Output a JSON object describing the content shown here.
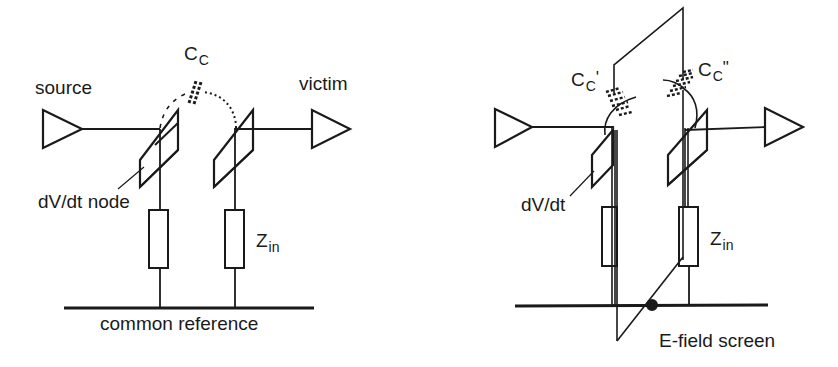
{
  "left_diagram": {
    "labels": {
      "source": "source",
      "victim": "victim",
      "coupling_cap_main": "C",
      "coupling_cap_sub": "C",
      "dvdt_node": "dV/dt node",
      "zin_main": "Z",
      "zin_sub": "in",
      "common_reference": "common reference"
    }
  },
  "right_diagram": {
    "labels": {
      "cc1_main": "C",
      "cc1_sub": "C",
      "cc1_prime": "'",
      "cc2_main": "C",
      "cc2_sub": "C",
      "cc2_prime": "\"",
      "dvdt": "dV/dt",
      "zin_main": "Z",
      "zin_sub": "in",
      "e_field_screen": "E-field screen"
    }
  },
  "colors": {
    "ink": "#1a1a1a",
    "background": "#ffffff"
  }
}
